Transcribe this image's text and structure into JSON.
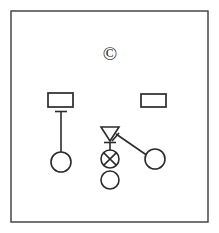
{
  "canvas": {
    "width": 219,
    "height": 233,
    "background": "#ffffff",
    "stroke_color": "#2b2b2b",
    "frame_color": "#3a3a3a"
  },
  "frame": {
    "label": "diagram-frame",
    "x": 11,
    "y": 11,
    "width": 197,
    "height": 211
  },
  "marks": {
    "copyright": {
      "glyph": "©",
      "name": "copyright-symbol",
      "cx": 110,
      "cy": 52
    }
  },
  "nodes": [
    {
      "id": "rect-left",
      "shape": "rectangle",
      "name": "left-rectangle-node",
      "x": 48,
      "y": 93,
      "width": 25,
      "height": 14
    },
    {
      "id": "rect-right",
      "shape": "rectangle",
      "name": "right-rectangle-node",
      "x": 141,
      "y": 94,
      "width": 25,
      "height": 13
    },
    {
      "id": "circle-left",
      "shape": "circle",
      "name": "left-circle-node",
      "cx": 61,
      "cy": 162,
      "r": 10
    },
    {
      "id": "circle-right",
      "shape": "circle",
      "name": "right-circle-node",
      "cx": 155,
      "cy": 159,
      "r": 10
    },
    {
      "id": "triangle-center",
      "shape": "triangle-down",
      "name": "center-triangle-node",
      "cx": 110,
      "top_y": 127,
      "half_width": 9,
      "height": 14
    },
    {
      "id": "circle-cross-center",
      "shape": "circle-with-cross",
      "name": "center-crossed-circle-node",
      "cx": 110,
      "cy": 159,
      "r": 9
    },
    {
      "id": "circle-bottom-center",
      "shape": "circle",
      "name": "bottom-circle-node",
      "cx": 110,
      "cy": 180,
      "r": 9
    }
  ],
  "connectors": [
    {
      "id": "conn-left-stem",
      "name": "left-vertical-connector",
      "type": "vertical-stem",
      "x": 61,
      "y1": 111,
      "y2": 152,
      "cap_half_width": 6,
      "cap_y": 111
    },
    {
      "id": "conn-center-stem",
      "name": "center-vertical-connector",
      "type": "vertical-stem",
      "x": 110,
      "y1": 142,
      "y2": 150,
      "cap_half_width": 6,
      "cap_y": 142
    },
    {
      "id": "conn-diagonal",
      "name": "diagonal-connector",
      "type": "diagonal",
      "x1": 116,
      "y1": 134,
      "x2": 146,
      "y2": 155
    },
    {
      "id": "conn-triangle-tick",
      "name": "triangle-tick-connector",
      "type": "tick",
      "x1": 113,
      "y1": 140,
      "x2": 119,
      "y2": 133
    }
  ]
}
